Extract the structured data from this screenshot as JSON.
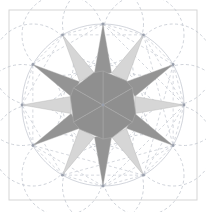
{
  "figure": {
    "title": "Twelve-pointed star construction",
    "type": "geometric-construction-diagram",
    "canvas": {
      "width": 206,
      "height": 212
    },
    "background_color": "#ffffff"
  },
  "frame": {
    "name": "bounding-square",
    "x": 9,
    "y": 10,
    "width": 188,
    "height": 190,
    "stroke_color": "#d5d5d5",
    "stroke_width": 1,
    "fill": "#ffffff"
  },
  "construction": {
    "center": {
      "x": 103,
      "y": 105
    },
    "main_circle_radius": 81,
    "node_circle_radius": 40.5,
    "node_count": 12,
    "node_angle_step_deg": 30,
    "node_start_angle_deg": -90,
    "dash_pattern": "3 2.5",
    "dash_color": "#b9bec9",
    "dash_width": 0.7,
    "main_circle_color": "#c6cad3",
    "node_marker_color": "#9aa0ad",
    "node_marker_radius": 1.4,
    "spoke_color": "#c3c7d0",
    "chord_color": "#c3c7d0",
    "show_grid": false,
    "show_inner_polygon": true
  },
  "star": {
    "name": "twelve-point-star",
    "points": 12,
    "outer_radius": 81,
    "inner_radius": 33,
    "center": {
      "x": 103,
      "y": 105
    },
    "rotation_deg": -90,
    "dark_fill": "#949494",
    "light_fill": "#d6d6d6",
    "edge_color": "#b0b0b0",
    "edge_width": 0.4,
    "alternating": true
  },
  "pinwheel": {
    "name": "center-pinwheel",
    "blade_count": 6,
    "fill": "#8f8f8f",
    "stroke": "#a9a9a9",
    "stroke_width": 0.6,
    "outer_radius": 34,
    "twist_deg": 14
  },
  "labels": {
    "figure_caption": "",
    "axis_labels": [],
    "annotations": []
  },
  "chart_data": {
    "type": "scatter",
    "title": "Twelve-pointed star construction",
    "categories": [
      "N",
      "NNE",
      "ENE",
      "E",
      "ESE",
      "SSE",
      "S",
      "SSW",
      "WSW",
      "W",
      "WNW",
      "NNW"
    ],
    "values": [
      81,
      81,
      81,
      81,
      81,
      81,
      81,
      81,
      81,
      81,
      81,
      81
    ],
    "xlabel": "",
    "ylabel": "",
    "legend": []
  }
}
